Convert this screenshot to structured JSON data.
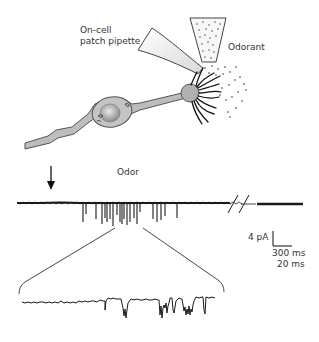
{
  "illustration": {
    "pipette_label_line1": "On-cell",
    "pipette_label_line2": "patch pipette",
    "odorant_label": "Odorant"
  },
  "recording": {
    "odor_label": "Odor",
    "scale_bar": {
      "current": "4 pA",
      "time_main": "300 ms",
      "time_expanded": "20 ms"
    },
    "break_symbol": "//"
  },
  "colors": {
    "trace": "#1a1a1a",
    "neuron_fill": "#b8b8b8",
    "neuron_outline": "#555555",
    "text": "#333333"
  }
}
